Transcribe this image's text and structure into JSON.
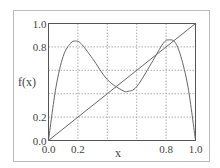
{
  "chart_data": {
    "type": "line",
    "title": "",
    "xlabel": "x",
    "ylabel": "f(x)",
    "xlim": [
      0.0,
      1.0
    ],
    "ylim": [
      0.0,
      1.0
    ],
    "grid": true,
    "grid_style": "dotted",
    "legend": null,
    "x_ticks": [
      0.0,
      0.2,
      0.4,
      0.6,
      0.8,
      1.0
    ],
    "x_tick_labels": [
      "0.0",
      "0.2",
      "",
      "",
      "0.8",
      "1.0"
    ],
    "y_ticks": [
      0.0,
      0.2,
      0.4,
      0.6,
      0.8,
      1.0
    ],
    "y_tick_labels": [
      "0.0",
      "0.2",
      "",
      "",
      "0.8",
      "1.0"
    ],
    "series": [
      {
        "name": "f(x)",
        "x": [
          0.0,
          0.05,
          0.1,
          0.15,
          0.18,
          0.22,
          0.3,
          0.4,
          0.5,
          0.54,
          0.6,
          0.7,
          0.78,
          0.82,
          0.86,
          0.9,
          0.95,
          1.0
        ],
        "y": [
          0.0,
          0.45,
          0.72,
          0.83,
          0.85,
          0.83,
          0.7,
          0.52,
          0.43,
          0.42,
          0.46,
          0.66,
          0.83,
          0.86,
          0.84,
          0.72,
          0.45,
          0.0
        ]
      },
      {
        "name": "y = x",
        "x": [
          0.0,
          1.0
        ],
        "y": [
          0.0,
          1.0
        ]
      }
    ]
  },
  "labels": {
    "x_axis": "x",
    "y_axis": "f(x)"
  }
}
